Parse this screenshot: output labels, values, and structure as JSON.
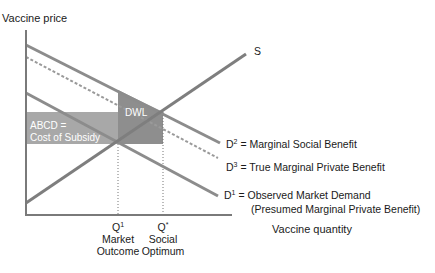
{
  "axes": {
    "y_label": "Vaccine price",
    "x_label": "Vaccine quantity"
  },
  "curves": {
    "supply": {
      "name": "S"
    },
    "d2": {
      "symbol": "D",
      "sup": "2",
      "text": " = Marginal Social Benefit"
    },
    "d3": {
      "symbol": "D",
      "sup": "3",
      "text": " = True Marginal Private Benefit"
    },
    "d1": {
      "symbol": "D",
      "sup": "1",
      "text": " = Observed Market Demand",
      "text2": "(Presumed Marginal Private Benefit)"
    }
  },
  "regions": {
    "subsidy_line1": "ABCD =",
    "subsidy_line2": "Cost of Subsidy",
    "dwl": "DWL"
  },
  "quantities": {
    "q1": {
      "symbol": "Q",
      "sup": "1",
      "line1": "Market",
      "line2": "Outcome"
    },
    "qstar": {
      "symbol": "Q",
      "sup": "*",
      "line1": "Social",
      "line2": "Optimum"
    }
  },
  "colors": {
    "line": "#8c8c8c",
    "subsidy_fill": "#a6a6a6",
    "dwl_fill": "#8f8f8f"
  }
}
